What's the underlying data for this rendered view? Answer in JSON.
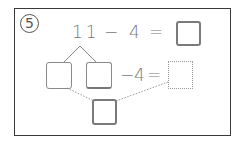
{
  "problem": {
    "number_label": "⑤",
    "number": "5",
    "equation_top": {
      "minuend": "11",
      "operator": "−",
      "subtrahend": "4",
      "equals": "=",
      "answer_box": ""
    },
    "equation_decomposed": {
      "part_box_left": "",
      "part_box_right": "",
      "operator": "−",
      "subtrahend": "4",
      "equals": "=",
      "result_box_dotted": ""
    },
    "combined_box": ""
  },
  "colors": {
    "frame": "#3a3a3a",
    "text": "#777777",
    "box_border": "#8a8a8a",
    "dotted_line": "#999999"
  }
}
